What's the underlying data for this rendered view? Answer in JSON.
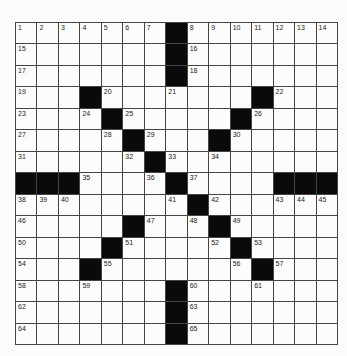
{
  "puzzle": {
    "rows": 15,
    "cols": 15,
    "grid": [
      "1234567#8999999",
      "x......#x......",
      "x......#x......",
      "x..#x..x...#x..",
      "x..x#x....#x...",
      "x...x#x..#x....",
      "x....x#x.x.....",
      "###x..x#x...###",
      "xxx....x#x..xxx",
      "x....#x.x#x....",
      "x...#x...x#x...",
      "x..#x.....x#x..",
      "x..x...#x..x...",
      "x......#x......",
      "x......#x......"
    ],
    "black_cells": [
      [
        0,
        7
      ],
      [
        1,
        7
      ],
      [
        2,
        7
      ],
      [
        3,
        3
      ],
      [
        3,
        11
      ],
      [
        4,
        4
      ],
      [
        4,
        10
      ],
      [
        5,
        5
      ],
      [
        5,
        9
      ],
      [
        6,
        6
      ],
      [
        7,
        0
      ],
      [
        7,
        1
      ],
      [
        7,
        2
      ],
      [
        7,
        7
      ],
      [
        7,
        12
      ],
      [
        7,
        13
      ],
      [
        7,
        14
      ],
      [
        8,
        8
      ],
      [
        9,
        5
      ],
      [
        9,
        9
      ],
      [
        10,
        4
      ],
      [
        10,
        10
      ],
      [
        11,
        3
      ],
      [
        11,
        11
      ],
      [
        12,
        7
      ],
      [
        13,
        7
      ],
      [
        14,
        7
      ]
    ],
    "numbers": [
      {
        "n": 1,
        "r": 0,
        "c": 0
      },
      {
        "n": 2,
        "r": 0,
        "c": 1
      },
      {
        "n": 3,
        "r": 0,
        "c": 2
      },
      {
        "n": 4,
        "r": 0,
        "c": 3
      },
      {
        "n": 5,
        "r": 0,
        "c": 4
      },
      {
        "n": 6,
        "r": 0,
        "c": 5
      },
      {
        "n": 7,
        "r": 0,
        "c": 6
      },
      {
        "n": 8,
        "r": 0,
        "c": 8
      },
      {
        "n": 9,
        "r": 0,
        "c": 9
      },
      {
        "n": 10,
        "r": 0,
        "c": 10
      },
      {
        "n": 11,
        "r": 0,
        "c": 11
      },
      {
        "n": 12,
        "r": 0,
        "c": 12
      },
      {
        "n": 13,
        "r": 0,
        "c": 13
      },
      {
        "n": 14,
        "r": 0,
        "c": 14
      },
      {
        "n": 15,
        "r": 1,
        "c": 0
      },
      {
        "n": 16,
        "r": 1,
        "c": 8
      },
      {
        "n": 17,
        "r": 2,
        "c": 0
      },
      {
        "n": 18,
        "r": 2,
        "c": 8
      },
      {
        "n": 19,
        "r": 3,
        "c": 0
      },
      {
        "n": 20,
        "r": 3,
        "c": 4
      },
      {
        "n": 21,
        "r": 3,
        "c": 7
      },
      {
        "n": 22,
        "r": 3,
        "c": 12
      },
      {
        "n": 23,
        "r": 4,
        "c": 0
      },
      {
        "n": 24,
        "r": 4,
        "c": 3
      },
      {
        "n": 25,
        "r": 4,
        "c": 5
      },
      {
        "n": 26,
        "r": 4,
        "c": 11
      },
      {
        "n": 27,
        "r": 5,
        "c": 0
      },
      {
        "n": 28,
        "r": 5,
        "c": 4
      },
      {
        "n": 29,
        "r": 5,
        "c": 6
      },
      {
        "n": 30,
        "r": 5,
        "c": 10
      },
      {
        "n": 31,
        "r": 6,
        "c": 0
      },
      {
        "n": 32,
        "r": 6,
        "c": 5
      },
      {
        "n": 33,
        "r": 6,
        "c": 7
      },
      {
        "n": 34,
        "r": 6,
        "c": 9
      },
      {
        "n": 35,
        "r": 7,
        "c": 3
      },
      {
        "n": 36,
        "r": 7,
        "c": 6
      },
      {
        "n": 37,
        "r": 7,
        "c": 8
      },
      {
        "n": 38,
        "r": 8,
        "c": 0
      },
      {
        "n": 39,
        "r": 8,
        "c": 1
      },
      {
        "n": 40,
        "r": 8,
        "c": 2
      },
      {
        "n": 41,
        "r": 8,
        "c": 7
      },
      {
        "n": 42,
        "r": 8,
        "c": 9
      },
      {
        "n": 43,
        "r": 8,
        "c": 12
      },
      {
        "n": 44,
        "r": 8,
        "c": 13
      },
      {
        "n": 45,
        "r": 8,
        "c": 14
      },
      {
        "n": 46,
        "r": 9,
        "c": 0
      },
      {
        "n": 47,
        "r": 9,
        "c": 6
      },
      {
        "n": 48,
        "r": 9,
        "c": 8
      },
      {
        "n": 49,
        "r": 9,
        "c": 10
      },
      {
        "n": 50,
        "r": 10,
        "c": 0
      },
      {
        "n": 51,
        "r": 10,
        "c": 5
      },
      {
        "n": 52,
        "r": 10,
        "c": 9
      },
      {
        "n": 53,
        "r": 10,
        "c": 11
      },
      {
        "n": 54,
        "r": 11,
        "c": 0
      },
      {
        "n": 55,
        "r": 11,
        "c": 4
      },
      {
        "n": 56,
        "r": 11,
        "c": 10
      },
      {
        "n": 57,
        "r": 11,
        "c": 12
      },
      {
        "n": 58,
        "r": 12,
        "c": 0
      },
      {
        "n": 59,
        "r": 12,
        "c": 3
      },
      {
        "n": 60,
        "r": 12,
        "c": 8
      },
      {
        "n": 61,
        "r": 12,
        "c": 11
      },
      {
        "n": 62,
        "r": 13,
        "c": 0
      },
      {
        "n": 63,
        "r": 13,
        "c": 8
      },
      {
        "n": 64,
        "r": 14,
        "c": 0
      },
      {
        "n": 65,
        "r": 14,
        "c": 8
      }
    ]
  }
}
